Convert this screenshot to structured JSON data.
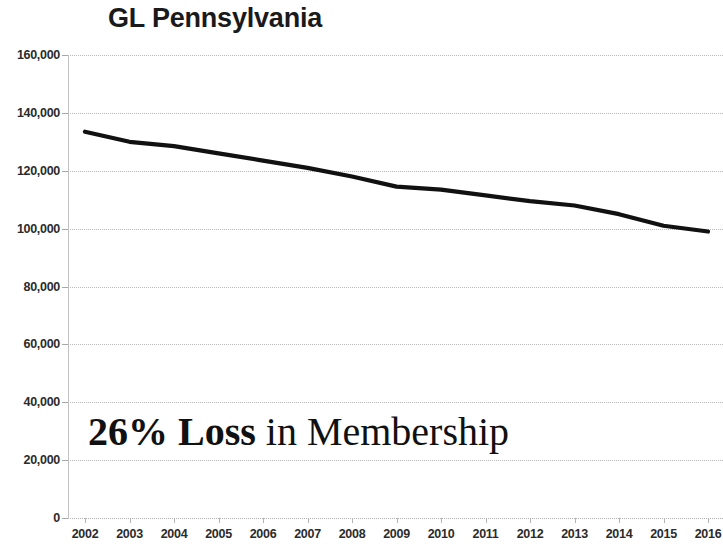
{
  "chart_data": {
    "type": "line",
    "title": "GL Pennsylvania",
    "xlabel": "",
    "ylabel": "",
    "categories": [
      "2002",
      "2003",
      "2004",
      "2005",
      "2006",
      "2007",
      "2008",
      "2009",
      "2010",
      "2011",
      "2012",
      "2013",
      "2014",
      "2015",
      "2016"
    ],
    "values": [
      133500,
      130000,
      128500,
      126000,
      123500,
      121000,
      118000,
      114500,
      113500,
      111500,
      109500,
      108000,
      105000,
      101000,
      99000
    ],
    "series": [
      {
        "name": "Membership",
        "values": [
          133500,
          130000,
          128500,
          126000,
          123500,
          121000,
          118000,
          114500,
          113500,
          111500,
          109500,
          108000,
          105000,
          101000,
          99000
        ]
      }
    ],
    "ylim": [
      0,
      160000
    ],
    "y_ticks": [
      0,
      20000,
      40000,
      60000,
      80000,
      100000,
      120000,
      140000,
      160000
    ],
    "y_tick_labels": [
      "0",
      "20,000",
      "40,000",
      "60,000",
      "80,000",
      "100,000",
      "120,000",
      "140,000",
      "160,000"
    ],
    "grid": true,
    "legend": false,
    "legend_position": "none",
    "line_color": "#111111",
    "background_color": "#ffffff",
    "grid_color": "#b9b9b9",
    "annotations": [
      {
        "text": "26% Loss in Membership",
        "bold_part": "26% Loss",
        "regular_part": " in Membership"
      }
    ]
  },
  "annotation": {
    "bold_text": "26% Loss",
    "regular_text": " in Membership"
  }
}
